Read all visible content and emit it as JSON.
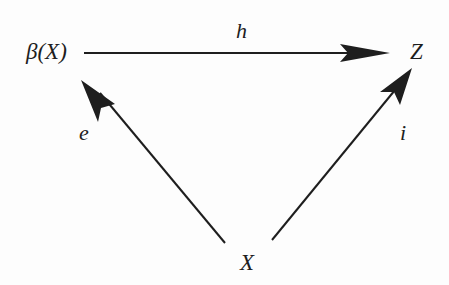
{
  "diagram": {
    "type": "commutative-triangle",
    "nodes": {
      "beta_x": "β(X)",
      "z": "Z",
      "x": "X"
    },
    "edges": {
      "h": {
        "label": "h",
        "from": "β(X)",
        "to": "Z"
      },
      "e": {
        "label": "e",
        "from": "X",
        "to": "β(X)"
      },
      "i": {
        "label": "i",
        "from": "X",
        "to": "Z"
      }
    },
    "colors": {
      "ink": "#1e1e1e",
      "background": "#fdfdfd"
    }
  }
}
